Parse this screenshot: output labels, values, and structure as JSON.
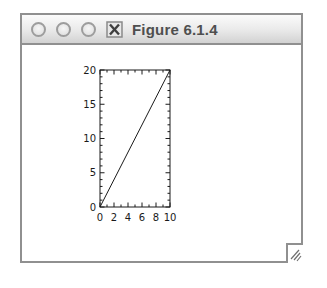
{
  "window": {
    "title": "Figure 6.1.4",
    "titlebar_buttons": [
      "circle-button",
      "circle-button",
      "circle-button"
    ],
    "app_icon": "x11-x-icon",
    "resize_grip_icon": "resize-grip-icon"
  },
  "colors": {
    "window_border": "#909090",
    "titlebar_top": "#fbfbfb",
    "titlebar_bottom": "#d2d2d2",
    "axis": "#1a1a1a",
    "title_text": "#4f4f4f"
  },
  "chart_data": {
    "type": "line",
    "title": "",
    "xlabel": "",
    "ylabel": "",
    "x": [
      0,
      10
    ],
    "y": [
      0,
      20
    ],
    "xlim": [
      0,
      10
    ],
    "ylim": [
      0,
      20
    ],
    "xticks": [
      0,
      2,
      4,
      6,
      8,
      10
    ],
    "yticks": [
      0,
      5,
      10,
      15,
      20
    ],
    "minor_tick_step_x": 1,
    "minor_tick_step_y": 1,
    "tick_direction": "in",
    "tick_sides": "all",
    "grid": false,
    "legend": false
  }
}
